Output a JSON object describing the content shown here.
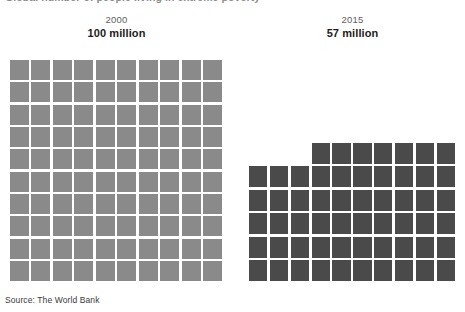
{
  "title": "Global number of people living in extreme poverty",
  "source_note": "Source: The World Bank",
  "colors": {
    "grid_2000": "#8a8a8a",
    "grid_2015": "#4a4a4a",
    "background": "#ffffff",
    "year_text": "#5d5d5d",
    "value_text": "#1c1c1c"
  },
  "panels": [
    {
      "id": "2000",
      "year": "2000",
      "value": "100 million",
      "unit_count": 100,
      "columns": 10,
      "rows": 10,
      "color": "#8a8a8a"
    },
    {
      "id": "2015",
      "year": "2015",
      "value": "57 million",
      "unit_count": 57,
      "columns": 10,
      "rows": 6,
      "top_row_offset": 3,
      "top_row_count": 7,
      "color": "#4a4a4a"
    }
  ],
  "chart_data": {
    "type": "bar",
    "chart_style": "waffle-unit-chart",
    "title": "Global number of people living in extreme poverty",
    "categories": [
      "2000",
      "2015"
    ],
    "values": [
      100,
      57
    ],
    "value_labels": [
      "100 million",
      "57 million"
    ],
    "unit_value": 1,
    "unit_description": "each square = 1 million people",
    "xlabel": "",
    "ylabel": "",
    "ylim": [
      0,
      100
    ],
    "grid": false,
    "legend": "none",
    "series": [
      {
        "name": "People in extreme poverty (millions)",
        "values": [
          100,
          57
        ]
      }
    ],
    "annotations": [
      "Source: The World Bank"
    ]
  }
}
